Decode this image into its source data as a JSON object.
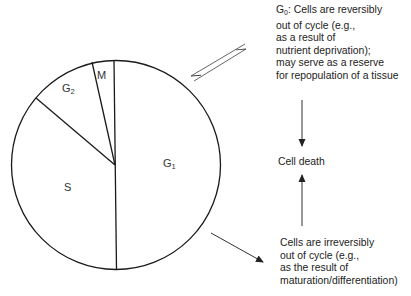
{
  "diagram": {
    "type": "cell-cycle-pie",
    "phases": [
      {
        "id": "G1",
        "label": "G",
        "subscript": "1"
      },
      {
        "id": "S",
        "label": "S",
        "subscript": ""
      },
      {
        "id": "G2",
        "label": "G",
        "subscript": "2"
      },
      {
        "id": "M",
        "label": "M",
        "subscript": ""
      }
    ],
    "g0": {
      "prefix": "G",
      "subscript": "0",
      "lines": [
        ": Cells are reversibly",
        "out of cycle (e.g.,",
        "as a result of",
        "nutrient deprivation);",
        "may serve as a reserve",
        "for repopulation of a tissue"
      ]
    },
    "cell_death": "Cell death",
    "irreversible": {
      "lines": [
        "Cells are irreversibly",
        "out of cycle (e.g.,",
        "as the result of",
        "maturation/differentiation)"
      ]
    },
    "colors": {
      "stroke": "#1a1a1a",
      "arrow": "#333333",
      "background": "#ffffff"
    }
  }
}
